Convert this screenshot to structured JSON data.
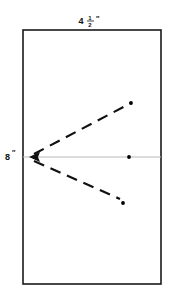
{
  "figure": {
    "title_text": "",
    "labels": {
      "width_label": {
        "whole": "4",
        "frac_numerator": "1",
        "frac_denominator": "2",
        "unit_mark": "″",
        "full_text": "4½″",
        "position": "top-center"
      },
      "height_label": {
        "value": "8",
        "unit_mark": "″",
        "full_text": "8″",
        "position": "left-middle"
      }
    },
    "colors": {
      "outline": "#1a1a1a",
      "center_line": "#b8b8b8",
      "dashed_line": "#111111",
      "dot": "#000000",
      "text": "#111111",
      "background": "#ffffff"
    },
    "rectangle": {
      "x": 23,
      "y": 30,
      "width": 138,
      "height": 254,
      "stroke_width": 1.6
    },
    "center_line": {
      "x1": 23,
      "y1": 157,
      "x2": 161,
      "y2": 157,
      "stroke_width": 1
    },
    "arrow": {
      "tip_x": 29,
      "tip_y": 157,
      "direction": "left"
    },
    "dashed_rays": [
      {
        "name": "upper-ray",
        "x1": 34,
        "y1": 154,
        "x2": 131,
        "y2": 103,
        "dash_pattern": "11 7",
        "stroke_width": 2.2
      },
      {
        "name": "lower-ray",
        "x1": 34,
        "y1": 161,
        "x2": 120,
        "y2": 199,
        "dash_pattern": "11 7",
        "stroke_width": 2.2
      }
    ],
    "dots": [
      {
        "name": "center-line-dot",
        "cx": 129,
        "cy": 157,
        "r": 1.9
      },
      {
        "name": "upper-ray-dot",
        "cx": 131,
        "cy": 103,
        "r": 1.9
      },
      {
        "name": "lower-ray-dot",
        "cx": 123,
        "cy": 203,
        "r": 1.9
      }
    ]
  }
}
